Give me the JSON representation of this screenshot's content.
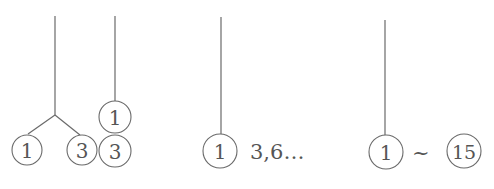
{
  "diagram": {
    "panel1": {
      "tree_left": {
        "leaves": [
          "1",
          "3"
        ]
      },
      "tree_right": {
        "nodes": [
          "1",
          "3"
        ]
      }
    },
    "panel2": {
      "node": "1",
      "suffix": "3,6…"
    },
    "panel3": {
      "start": "1",
      "separator": "~",
      "end": "15"
    }
  }
}
